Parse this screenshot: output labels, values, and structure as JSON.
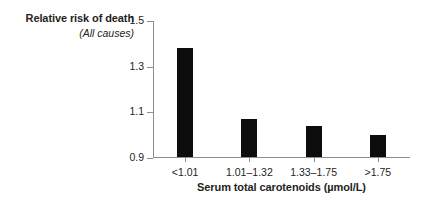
{
  "chart_data": {
    "type": "bar",
    "title": "",
    "ylabel": "Relative risk of death",
    "ylabel_sub": "(All causes)",
    "xlabel": "Serum total carotenoids (µmol/L)",
    "categories": [
      "<1.01",
      "1.01–1.32",
      "1.33–1.75",
      ">1.75"
    ],
    "values": [
      1.38,
      1.07,
      1.04,
      1.0
    ],
    "ylim": [
      0.9,
      1.5
    ],
    "yticks": [
      0.9,
      1.1,
      1.3,
      1.5
    ],
    "ytick_labels": [
      "0.9",
      "1.1",
      "1.3",
      "1.5"
    ],
    "grid": false,
    "legend": "none",
    "bar_color": "#0d0d0d",
    "axis_color": "#8d8d8d",
    "background": "#ffffff"
  }
}
